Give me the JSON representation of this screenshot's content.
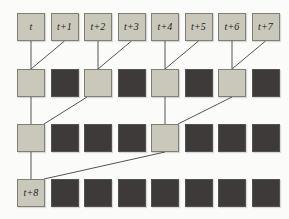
{
  "diagram": {
    "colors": {
      "background": "#fbfbf9",
      "light_square": "#cac8bb",
      "dark_square": "#3e3a3a",
      "light_border": "#7f7f7a",
      "dark_border": "#565050",
      "line": "#555555",
      "label_text": "#1c1c1c"
    },
    "rows": [
      {
        "name": "input-timestep-row",
        "cells": [
          {
            "shade": "light",
            "label": "t"
          },
          {
            "shade": "light",
            "label": "t+1"
          },
          {
            "shade": "light",
            "label": "t+2"
          },
          {
            "shade": "light",
            "label": "t+3"
          },
          {
            "shade": "light",
            "label": "t+4"
          },
          {
            "shade": "light",
            "label": "t+5"
          },
          {
            "shade": "light",
            "label": "t+6"
          },
          {
            "shade": "light",
            "label": "t+7"
          }
        ]
      },
      {
        "name": "level-1-row",
        "cells": [
          {
            "shade": "light",
            "label": ""
          },
          {
            "shade": "dark",
            "label": ""
          },
          {
            "shade": "light",
            "label": ""
          },
          {
            "shade": "dark",
            "label": ""
          },
          {
            "shade": "light",
            "label": ""
          },
          {
            "shade": "dark",
            "label": ""
          },
          {
            "shade": "light",
            "label": ""
          },
          {
            "shade": "dark",
            "label": ""
          }
        ]
      },
      {
        "name": "level-2-row",
        "cells": [
          {
            "shade": "light",
            "label": ""
          },
          {
            "shade": "dark",
            "label": ""
          },
          {
            "shade": "dark",
            "label": ""
          },
          {
            "shade": "dark",
            "label": ""
          },
          {
            "shade": "light",
            "label": ""
          },
          {
            "shade": "dark",
            "label": ""
          },
          {
            "shade": "dark",
            "label": ""
          },
          {
            "shade": "dark",
            "label": ""
          }
        ]
      },
      {
        "name": "output-row",
        "cells": [
          {
            "shade": "light",
            "label": "t+8"
          },
          {
            "shade": "dark",
            "label": ""
          },
          {
            "shade": "dark",
            "label": ""
          },
          {
            "shade": "dark",
            "label": ""
          },
          {
            "shade": "dark",
            "label": ""
          },
          {
            "shade": "dark",
            "label": ""
          },
          {
            "shade": "dark",
            "label": ""
          },
          {
            "shade": "dark",
            "label": ""
          }
        ]
      }
    ],
    "connections": [
      {
        "from": {
          "row": 0,
          "col": 0,
          "anchor": "bottom-center"
        },
        "to": {
          "row": 1,
          "col": 0,
          "anchor": "top-center"
        }
      },
      {
        "from": {
          "row": 0,
          "col": 1,
          "anchor": "bottom-center"
        },
        "to": {
          "row": 1,
          "col": 0,
          "anchor": "top-center"
        }
      },
      {
        "from": {
          "row": 0,
          "col": 2,
          "anchor": "bottom-center"
        },
        "to": {
          "row": 1,
          "col": 2,
          "anchor": "top-center"
        }
      },
      {
        "from": {
          "row": 0,
          "col": 3,
          "anchor": "bottom-center"
        },
        "to": {
          "row": 1,
          "col": 2,
          "anchor": "top-center"
        }
      },
      {
        "from": {
          "row": 0,
          "col": 4,
          "anchor": "bottom-center"
        },
        "to": {
          "row": 1,
          "col": 4,
          "anchor": "top-center"
        }
      },
      {
        "from": {
          "row": 0,
          "col": 5,
          "anchor": "bottom-center"
        },
        "to": {
          "row": 1,
          "col": 4,
          "anchor": "top-center"
        }
      },
      {
        "from": {
          "row": 0,
          "col": 6,
          "anchor": "bottom-center"
        },
        "to": {
          "row": 1,
          "col": 6,
          "anchor": "top-center"
        }
      },
      {
        "from": {
          "row": 0,
          "col": 7,
          "anchor": "bottom-center"
        },
        "to": {
          "row": 1,
          "col": 6,
          "anchor": "top-center"
        }
      },
      {
        "from": {
          "row": 1,
          "col": 0,
          "anchor": "bottom-center"
        },
        "to": {
          "row": 2,
          "col": 0,
          "anchor": "top-center"
        }
      },
      {
        "from": {
          "row": 1,
          "col": 2,
          "anchor": "bottom-left"
        },
        "to": {
          "row": 2,
          "col": 0,
          "anchor": "top-right"
        }
      },
      {
        "from": {
          "row": 1,
          "col": 4,
          "anchor": "bottom-center"
        },
        "to": {
          "row": 2,
          "col": 4,
          "anchor": "top-center"
        }
      },
      {
        "from": {
          "row": 1,
          "col": 6,
          "anchor": "bottom-center"
        },
        "to": {
          "row": 2,
          "col": 4,
          "anchor": "top-right"
        }
      },
      {
        "from": {
          "row": 2,
          "col": 0,
          "anchor": "bottom-center"
        },
        "to": {
          "row": 3,
          "col": 0,
          "anchor": "top-center"
        }
      },
      {
        "from": {
          "row": 2,
          "col": 4,
          "anchor": "bottom-center"
        },
        "to": {
          "row": 3,
          "col": 0,
          "anchor": "top-right"
        }
      }
    ]
  }
}
